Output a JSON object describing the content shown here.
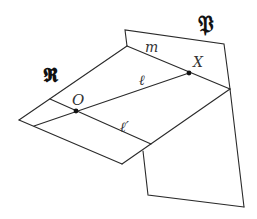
{
  "diagram": {
    "type": "geometry-planes",
    "colors": {
      "stroke": "#2a2a2a",
      "point": "#111111",
      "background": "#ffffff"
    },
    "planes": [
      {
        "id": "P",
        "label": "𝔓"
      },
      {
        "id": "R",
        "label": "𝕽"
      }
    ],
    "lines": [
      {
        "id": "m",
        "label": "m"
      },
      {
        "id": "l",
        "label": "ℓ"
      },
      {
        "id": "l_prime",
        "label": "ℓ′"
      }
    ],
    "points": [
      {
        "id": "O",
        "label": "O"
      },
      {
        "id": "X",
        "label": "X"
      }
    ]
  },
  "labels": {
    "plane_p": "𝔓",
    "plane_r": "𝕽",
    "line_m": "m",
    "line_l": "ℓ",
    "line_l_prime": "ℓ′",
    "point_o": "O",
    "point_x": "X"
  }
}
